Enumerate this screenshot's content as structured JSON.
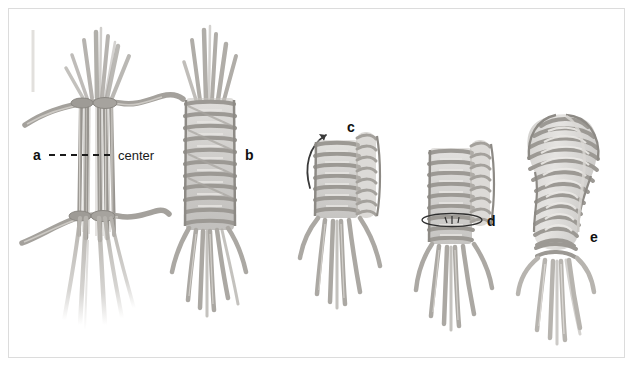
{
  "figure": {
    "background_color": "#ffffff",
    "frame_color": "#dcdcdc",
    "fiber_color": "#b5b2ad",
    "fiber_shadow_color": "#8f8c87",
    "fiber_highlight_color": "#d9d7d3",
    "label_color": "#101010",
    "width": 634,
    "height": 367
  },
  "annotations": {
    "center_line_label": "center",
    "center_line_style": "dashed"
  },
  "steps": [
    {
      "id": "a",
      "label": "a",
      "label_x": 33,
      "label_y": 148,
      "description": "Bundle of fibers tied at two points with wavy binding strands; dashed center line marked"
    },
    {
      "id": "b",
      "label": "b",
      "label_x": 245,
      "label_y": 148,
      "description": "Bundle folded and wrapped with coiled horizontal bands, loose ends hanging below"
    },
    {
      "id": "c",
      "label": "c",
      "label_x": 347,
      "label_y": 120,
      "description": "Second coil started up the right side, curved arrow shows wrapping direction"
    },
    {
      "id": "d",
      "label": "d",
      "label_x": 487,
      "label_y": 214,
      "description": "Stitch detail circled on the coil, column continues to build"
    },
    {
      "id": "e",
      "label": "e",
      "label_x": 590,
      "label_y": 230,
      "description": "Completed bulbous coiled head with fringe of loose fiber ends"
    }
  ],
  "arrow": {
    "name": "rotation-arrow",
    "points_to": "c",
    "direction": "counter-clockwise-up"
  }
}
